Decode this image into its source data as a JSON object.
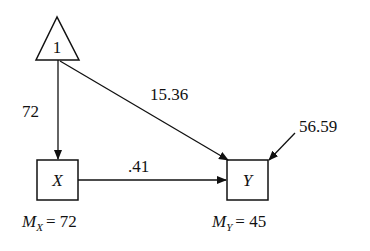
{
  "diagram": {
    "type": "path-diagram",
    "nodes": {
      "constant": {
        "shape": "triangle",
        "label": "1"
      },
      "x": {
        "shape": "square",
        "label": "X"
      },
      "y": {
        "shape": "square",
        "label": "Y"
      }
    },
    "paths": {
      "constant_to_x": {
        "label": "72"
      },
      "constant_to_y": {
        "label": "15.36"
      },
      "x_to_y": {
        "label": ".41"
      },
      "error_to_y": {
        "label": "56.59"
      }
    },
    "means": {
      "x": {
        "symbol": "M",
        "subscript": "X",
        "equals": "= 72"
      },
      "y": {
        "symbol": "M",
        "subscript": "Y",
        "equals": "= 45"
      }
    },
    "colors": {
      "stroke": "#111111",
      "background": "#ffffff"
    }
  }
}
